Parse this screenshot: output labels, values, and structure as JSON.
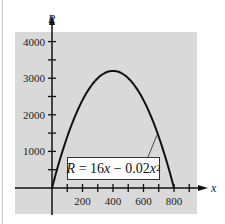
{
  "chart_data": {
    "type": "line",
    "title": "",
    "xlabel": "x",
    "ylabel": "R",
    "xlim": [
      0,
      900
    ],
    "ylim": [
      0,
      4200
    ],
    "x_ticks": [
      100,
      200,
      300,
      400,
      500,
      600,
      700,
      800,
      900
    ],
    "x_tick_labels": [
      "200",
      "400",
      "600",
      "800"
    ],
    "x_tick_label_values": [
      200,
      400,
      600,
      800
    ],
    "y_ticks": [
      500,
      1000,
      1500,
      2000,
      2500,
      3000,
      3500,
      4000
    ],
    "y_tick_labels": [
      "1000",
      "2000",
      "3000",
      "4000"
    ],
    "y_tick_label_values": [
      1000,
      2000,
      3000,
      4000
    ],
    "grid": false,
    "background": "#d9d9d9",
    "line_color": "#111111",
    "series": [
      {
        "name": "R = 16x - 0.02x^2",
        "function": "16x - 0.02x^2",
        "x": [
          0,
          100,
          200,
          300,
          400,
          500,
          600,
          700,
          800
        ],
        "values": [
          0,
          1400,
          2400,
          3000,
          3200,
          3000,
          2400,
          1400,
          0
        ]
      }
    ],
    "annotations": [
      {
        "text": "R = 16x - 0.02x^2",
        "points_to_x": 690,
        "points_to_y": 1450
      }
    ]
  },
  "labels": {
    "y_axis": "R",
    "x_axis": "x",
    "equation_lhs": "R",
    "equation_mid": " = 16",
    "equation_x1": "x",
    "equation_minus": " − 0.02",
    "equation_x2": "x",
    "equation_exp": "2"
  }
}
